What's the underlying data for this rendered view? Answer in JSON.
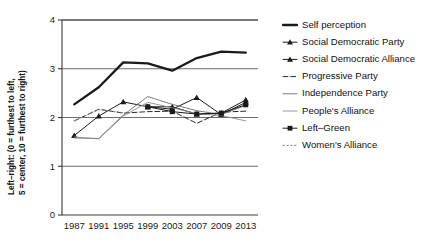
{
  "chart_data": {
    "type": "line",
    "title": "",
    "xlabel": "",
    "ylabel": "Left–right: (0 = furthest to left, 5 = center, 10 = furthest to right)",
    "ylabel_line1": "Left–right: (0 = furthest to left,",
    "ylabel_line2": "5 = center, 10 = furthest to right)",
    "categories": [
      "1987",
      "1991",
      "1995",
      "1999",
      "2003",
      "2007",
      "2009",
      "2013"
    ],
    "x": [
      1987,
      1991,
      1995,
      1999,
      2003,
      2007,
      2009,
      2013
    ],
    "ylim": [
      0,
      4
    ],
    "yticks": [
      0,
      1,
      2,
      3,
      4
    ],
    "ytick_labels": [
      "0",
      "1",
      "2",
      "3",
      "4"
    ],
    "grid": "horizontal",
    "legend_position": "right",
    "series": [
      {
        "name": "Self perception",
        "values": [
          2.27,
          2.62,
          3.13,
          3.11,
          2.96,
          3.22,
          3.35,
          3.33
        ],
        "style": "solid",
        "width": 2.3,
        "color": "#1a1a1a",
        "marker": "none"
      },
      {
        "name": "Social Democratic Party",
        "values": [
          1.63,
          2.03,
          2.32,
          2.22,
          2.22,
          2.07,
          2.09,
          2.36
        ],
        "style": "solid",
        "width": 1.0,
        "color": "#1a1a1a",
        "marker": "triangle"
      },
      {
        "name": "Social Democratic Alliance",
        "values": [
          null,
          null,
          null,
          2.22,
          2.17,
          2.41,
          2.06,
          2.31
        ],
        "style": "solid",
        "width": 1.0,
        "color": "#1a1a1a",
        "marker": "triangle"
      },
      {
        "name": "Progressive Party",
        "values": [
          1.93,
          2.17,
          2.09,
          2.12,
          2.13,
          1.88,
          2.11,
          2.13
        ],
        "style": "dashed",
        "width": 1.0,
        "color": "#2b2b2b",
        "marker": "none"
      },
      {
        "name": "Independence Party",
        "values": [
          1.58,
          1.57,
          2.05,
          2.43,
          2.27,
          2.14,
          2.06,
          2.25
        ],
        "style": "solid",
        "width": 0.9,
        "color": "#6e6e6e",
        "marker": "none"
      },
      {
        "name": "People's Alliance",
        "values": [
          1.6,
          1.56,
          2.03,
          2.31,
          2.2,
          2.08,
          2.04,
          1.93
        ],
        "style": "solid",
        "width": 0.9,
        "color": "#8a8a8a",
        "marker": "none"
      },
      {
        "name": "Left–Green",
        "values": [
          null,
          null,
          null,
          2.22,
          2.12,
          2.07,
          2.09,
          2.26
        ],
        "style": "solid",
        "width": 1.0,
        "color": "#1a1a1a",
        "marker": "square"
      },
      {
        "name": "Women's Alliance",
        "values": [
          1.93,
          2.16,
          2.1,
          null,
          null,
          null,
          null,
          null
        ],
        "style": "dotted",
        "width": 1.0,
        "color": "#8a8a8a",
        "marker": "none"
      }
    ]
  },
  "legend": {
    "items": [
      {
        "label": "Self perception"
      },
      {
        "label": "Social Democratic Party"
      },
      {
        "label": "Social Democratic Alliance"
      },
      {
        "label": "Progressive Party"
      },
      {
        "label": "Independence Party"
      },
      {
        "label": "People's Alliance"
      },
      {
        "label": "Left–Green"
      },
      {
        "label": "Women's Alliance"
      }
    ]
  },
  "colors": {
    "axis": "#3a3a3a",
    "grid": "#5b5b5b",
    "text": "#111111",
    "background": "#ffffff"
  }
}
